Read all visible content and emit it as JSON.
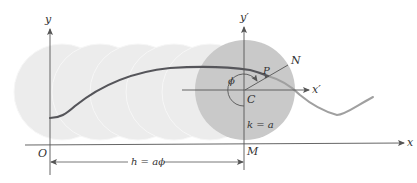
{
  "figure": {
    "colors": {
      "background": "#ffffff",
      "ghost_circle": "#ececec",
      "ghost_circle_edge": "#f6f6f6",
      "active_circle": "#c9c9c9",
      "curve_dark": "#55555a",
      "curve_light": "#9a9a9a",
      "axis": "#555555"
    },
    "labels": {
      "y_axis": "y",
      "x_axis": "x",
      "origin": "O",
      "y_prime_axis": "y′",
      "x_prime_axis": "x′",
      "center": "C",
      "point_p": "P",
      "point_n": "N",
      "point_m": "M",
      "angle": "ϕ",
      "radius_eq": "k = a",
      "distance_eq": "h = aϕ"
    },
    "ghost_circles": [
      {
        "cx": 62,
        "cy": 92,
        "r": 48
      },
      {
        "cx": 100,
        "cy": 92,
        "r": 48
      },
      {
        "cx": 138,
        "cy": 92,
        "r": 48
      },
      {
        "cx": 174,
        "cy": 92,
        "r": 48
      },
      {
        "cx": 210,
        "cy": 92,
        "r": 48
      }
    ],
    "active_circle": {
      "cx": 245,
      "cy": 90,
      "r": 50
    }
  }
}
